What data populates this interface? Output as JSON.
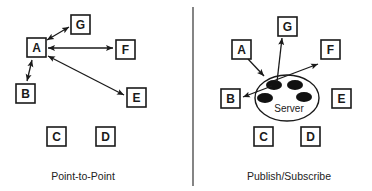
{
  "colors": {
    "ink": "#1a1a1a",
    "background": "#ffffff"
  },
  "panels": {
    "point_to_point": {
      "caption": "Point-to-Point",
      "nodes": {
        "A": "A",
        "B": "B",
        "C": "C",
        "D": "D",
        "E": "E",
        "F": "F",
        "G": "G"
      },
      "edges": [
        {
          "from": "A",
          "to": "G",
          "direction": "bidirectional"
        },
        {
          "from": "A",
          "to": "F",
          "direction": "bidirectional"
        },
        {
          "from": "A",
          "to": "E",
          "direction": "bidirectional"
        },
        {
          "from": "A",
          "to": "B",
          "direction": "bidirectional"
        }
      ]
    },
    "publish_subscribe": {
      "caption": "Publish/Subscribe",
      "server_label": "Server",
      "nodes": {
        "A": "A",
        "B": "B",
        "C": "C",
        "D": "D",
        "E": "E",
        "F": "F",
        "G": "G"
      },
      "edges": [
        {
          "from": "A",
          "to": "Server",
          "direction": "forward"
        },
        {
          "from": "Server",
          "to": "G",
          "direction": "forward"
        },
        {
          "from": "Server",
          "to": "F",
          "direction": "forward"
        },
        {
          "from": "Server",
          "to": "B",
          "direction": "forward"
        }
      ]
    }
  }
}
